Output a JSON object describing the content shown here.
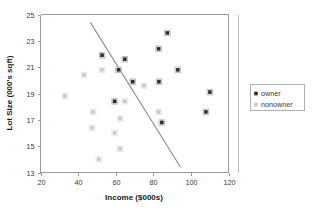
{
  "chart_data": {
    "type": "scatter",
    "title": "",
    "xlabel": "Income ($000s)",
    "ylabel": "Lot Size (000's sqft)",
    "xlim": [
      20,
      120
    ],
    "ylim": [
      13,
      25
    ],
    "xticks": [
      20,
      40,
      60,
      80,
      100,
      120
    ],
    "yticks": [
      13,
      15,
      17,
      19,
      21,
      23,
      25
    ],
    "grid": false,
    "legend_position": "right",
    "series": [
      {
        "name": "owner",
        "marker": "filled-square",
        "color": "#2b2b2b",
        "points": [
          {
            "x": 52.8,
            "y": 21.9
          },
          {
            "x": 64.8,
            "y": 21.6
          },
          {
            "x": 61.5,
            "y": 20.8
          },
          {
            "x": 87.5,
            "y": 23.6
          },
          {
            "x": 82.8,
            "y": 22.4
          },
          {
            "x": 93.0,
            "y": 20.8
          },
          {
            "x": 69.0,
            "y": 19.9
          },
          {
            "x": 83.0,
            "y": 19.9
          },
          {
            "x": 110.1,
            "y": 19.1
          },
          {
            "x": 59.4,
            "y": 18.4
          },
          {
            "x": 108.0,
            "y": 17.6
          },
          {
            "x": 84.5,
            "y": 16.8
          }
        ]
      },
      {
        "name": "nonowner",
        "marker": "light-square",
        "color": "#c8c8c8",
        "points": [
          {
            "x": 52.8,
            "y": 20.8
          },
          {
            "x": 43.2,
            "y": 20.4
          },
          {
            "x": 75.0,
            "y": 19.6
          },
          {
            "x": 33.0,
            "y": 18.8
          },
          {
            "x": 64.8,
            "y": 18.4
          },
          {
            "x": 82.8,
            "y": 17.6
          },
          {
            "x": 48.0,
            "y": 17.6
          },
          {
            "x": 62.4,
            "y": 17.1
          },
          {
            "x": 47.4,
            "y": 16.4
          },
          {
            "x": 59.4,
            "y": 16.0
          },
          {
            "x": 62.4,
            "y": 14.8
          },
          {
            "x": 51.0,
            "y": 14.0
          }
        ]
      }
    ],
    "annotations": [
      {
        "type": "line",
        "name": "discriminant-line",
        "from": {
          "x": 46.5,
          "y": 24.4
        },
        "to": {
          "x": 94.5,
          "y": 13.4
        },
        "color": "#8b8b8b"
      }
    ]
  },
  "legend": {
    "entries": [
      {
        "label": "owner"
      },
      {
        "label": "nonowner"
      }
    ]
  },
  "icons": {
    "owner_marker": "filled-square-marker",
    "nonowner_marker": "light-square-marker"
  }
}
